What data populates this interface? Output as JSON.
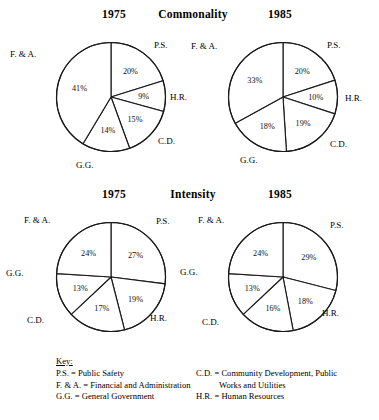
{
  "figure": {
    "sections": [
      {
        "id": "commonality",
        "title": "Commonality",
        "left_year": "1975",
        "right_year": "1985"
      },
      {
        "id": "intensity",
        "title": "Intensity",
        "left_year": "1975",
        "right_year": "1985"
      }
    ]
  },
  "labels": {
    "ps": "P.S.",
    "hr": "H.R.",
    "cd": "C.D.",
    "gg": "G.G.",
    "fa": "F. & A."
  },
  "key": {
    "title": "Key:",
    "left_entries": [
      "P.S. = Public Safety",
      "F. & A. = Financial and Administration",
      "G.G. = General Government"
    ],
    "right_entries": [
      "C.D. = Community Development, Public",
      "H.R. = Human Resources"
    ],
    "right_continuation": "Works and Utilities"
  },
  "chart_data": [
    {
      "type": "pie",
      "title": "Commonality 1975",
      "id": "commonality-1975",
      "group": "Commonality",
      "year": "1975",
      "categories": [
        "P.S.",
        "H.R.",
        "C.D.",
        "G.G.",
        "F. & A."
      ],
      "values": [
        20,
        9,
        15,
        14,
        41
      ],
      "labels": [
        "20%",
        "9%",
        "15%",
        "14%",
        "41%"
      ],
      "start_angle_deg": 0,
      "direction": "clockwise",
      "legend": "outside-labels"
    },
    {
      "type": "pie",
      "title": "Commonality 1985",
      "id": "commonality-1985",
      "group": "Commonality",
      "year": "1985",
      "categories": [
        "P.S.",
        "H.R.",
        "C.D.",
        "G.G.",
        "F. & A."
      ],
      "values": [
        20,
        10,
        19,
        18,
        33
      ],
      "labels": [
        "20%",
        "10%",
        "19%",
        "18%",
        "33%"
      ],
      "start_angle_deg": 0,
      "direction": "clockwise",
      "legend": "outside-labels"
    },
    {
      "type": "pie",
      "title": "Intensity 1975",
      "id": "intensity-1975",
      "group": "Intensity",
      "year": "1975",
      "categories": [
        "P.S.",
        "H.R.",
        "C.D.",
        "G.G.",
        "F. & A."
      ],
      "values": [
        27,
        19,
        17,
        13,
        24
      ],
      "labels": [
        "27%",
        "19%",
        "17%",
        "13%",
        "24%"
      ],
      "start_angle_deg": 0,
      "direction": "clockwise",
      "legend": "outside-labels"
    },
    {
      "type": "pie",
      "title": "Intensity 1985",
      "id": "intensity-1985",
      "group": "Intensity",
      "year": "1985",
      "categories": [
        "P.S.",
        "H.R.",
        "C.D.",
        "G.G.",
        "F. & A."
      ],
      "values": [
        29,
        18,
        16,
        13,
        24
      ],
      "labels": [
        "29%",
        "18%",
        "16%",
        "13%",
        "24%"
      ],
      "start_angle_deg": 0,
      "direction": "clockwise",
      "legend": "outside-labels"
    }
  ]
}
